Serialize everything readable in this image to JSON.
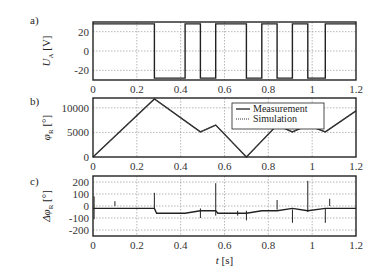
{
  "chart_data": [
    {
      "panel_label": "a)",
      "type": "line",
      "ylabel": "U_A [V]",
      "ylabel_main": "U",
      "ylabel_sub": "A",
      "ylabel_unit": "[V]",
      "xlim": [
        0,
        1.2
      ],
      "ylim": [
        -30,
        30
      ],
      "xticks": [
        "0",
        "0.2",
        "0.4",
        "0.6",
        "0.8",
        "1",
        "1.2"
      ],
      "yticks": [
        "20",
        "0",
        "-20"
      ],
      "ytick_values": [
        20,
        0,
        -20
      ],
      "grid": true,
      "series": [
        {
          "name": "Measurement",
          "style": "square wave",
          "x": [
            0,
            0.28,
            0.28,
            0.42,
            0.42,
            0.49,
            0.49,
            0.56,
            0.56,
            0.7,
            0.7,
            0.77,
            0.77,
            0.84,
            0.84,
            0.91,
            0.91,
            0.98,
            0.98,
            1.06,
            1.06,
            1.2
          ],
          "y": [
            28,
            28,
            -28,
            -28,
            28,
            28,
            -28,
            -28,
            28,
            28,
            -28,
            -28,
            28,
            28,
            -28,
            -28,
            28,
            28,
            -28,
            -28,
            28,
            28
          ]
        }
      ]
    },
    {
      "panel_label": "b)",
      "type": "line",
      "ylabel": "φ_R [°]",
      "ylabel_main": "φ",
      "ylabel_sub": "R",
      "ylabel_unit": "[°]",
      "xlim": [
        0,
        1.2
      ],
      "ylim": [
        0,
        12000
      ],
      "xticks": [
        "0",
        "0.2",
        "0.4",
        "0.6",
        "0.8",
        "1",
        "1.2"
      ],
      "yticks": [
        "10000",
        "5000",
        "0"
      ],
      "ytick_values": [
        10000,
        5000,
        0
      ],
      "grid": true,
      "legend": {
        "position": "upper right",
        "entries": [
          {
            "label": "Measurement",
            "style": "solid"
          },
          {
            "label": "Simulation",
            "style": "dotted"
          }
        ]
      },
      "series": [
        {
          "name": "Measurement",
          "x": [
            0,
            0.28,
            0.49,
            0.56,
            0.7,
            0.84,
            0.91,
            0.98,
            1.06,
            1.2
          ],
          "y": [
            0,
            11800,
            5100,
            6500,
            0,
            6500,
            5100,
            6500,
            5100,
            9400
          ]
        },
        {
          "name": "Simulation",
          "x": [
            0,
            0.28,
            0.49,
            0.56,
            0.7,
            0.84,
            0.91,
            0.98,
            1.06,
            1.2
          ],
          "y": [
            0,
            11800,
            5100,
            6500,
            0,
            6500,
            5100,
            6500,
            5100,
            9400
          ]
        }
      ]
    },
    {
      "panel_label": "c)",
      "type": "line",
      "ylabel": "Δφ_R [°]",
      "ylabel_main": "Δφ",
      "ylabel_sub": "R",
      "ylabel_unit": "[°]",
      "xlabel": "t [s]",
      "xlabel_var": "t",
      "xlabel_unit": "[s]",
      "xlim": [
        0,
        1.2
      ],
      "ylim": [
        -250,
        250
      ],
      "xticks": [
        "0",
        "0.2",
        "0.4",
        "0.6",
        "0.8",
        "1",
        "1.2"
      ],
      "yticks": [
        "200",
        "100",
        "0",
        "-100",
        "-200"
      ],
      "ytick_values": [
        200,
        100,
        0,
        -100,
        -200
      ],
      "grid": true,
      "series": [
        {
          "name": "Difference",
          "x": [
            0,
            0.01,
            0.28,
            0.29,
            0.42,
            0.49,
            0.56,
            0.57,
            0.7,
            0.77,
            0.84,
            0.91,
            0.98,
            1.06,
            1.2
          ],
          "y": [
            -20,
            -20,
            -20,
            -60,
            -60,
            -40,
            -40,
            -60,
            -60,
            -40,
            -40,
            -20,
            -40,
            -20,
            -20
          ]
        }
      ]
    }
  ]
}
